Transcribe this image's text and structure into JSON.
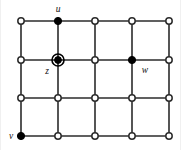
{
  "figure": {
    "background_color": "#ffffff",
    "edge_color": "#2b2b2b",
    "vertex_fill_color": "#000000",
    "vertex_open_color": "#ffffff",
    "label_color": "#111111"
  },
  "chart_data": {
    "type": "diagram",
    "subtype": "grid-graph",
    "title": "",
    "grid": {
      "columns": 5,
      "rows": 4,
      "column_x": [
        21,
        58,
        95,
        132,
        169
      ],
      "row_y": [
        21,
        60,
        98,
        136
      ],
      "cells_wide": 4,
      "cells_tall": 3
    },
    "vertices": [
      {
        "id": "r1c1",
        "col": 1,
        "row": 1,
        "x": 21,
        "y": 21,
        "style": "open",
        "label": ""
      },
      {
        "id": "r1c2",
        "col": 2,
        "row": 1,
        "x": 58,
        "y": 21,
        "style": "filled",
        "label": "u",
        "label_pos": "above"
      },
      {
        "id": "r1c3",
        "col": 3,
        "row": 1,
        "x": 95,
        "y": 21,
        "style": "open",
        "label": ""
      },
      {
        "id": "r1c4",
        "col": 4,
        "row": 1,
        "x": 132,
        "y": 21,
        "style": "open",
        "label": ""
      },
      {
        "id": "r1c5",
        "col": 5,
        "row": 1,
        "x": 169,
        "y": 21,
        "style": "open",
        "label": ""
      },
      {
        "id": "r2c1",
        "col": 1,
        "row": 2,
        "x": 21,
        "y": 60,
        "style": "open",
        "label": ""
      },
      {
        "id": "r2c2",
        "col": 2,
        "row": 2,
        "x": 58,
        "y": 60,
        "style": "ringed",
        "label": "z",
        "label_pos": "below-left"
      },
      {
        "id": "r2c3",
        "col": 3,
        "row": 2,
        "x": 95,
        "y": 60,
        "style": "open",
        "label": ""
      },
      {
        "id": "r2c4",
        "col": 4,
        "row": 2,
        "x": 132,
        "y": 60,
        "style": "filled",
        "label": "w",
        "label_pos": "below-right"
      },
      {
        "id": "r2c5",
        "col": 5,
        "row": 2,
        "x": 169,
        "y": 60,
        "style": "open",
        "label": ""
      },
      {
        "id": "r3c1",
        "col": 1,
        "row": 3,
        "x": 21,
        "y": 98,
        "style": "open",
        "label": ""
      },
      {
        "id": "r3c2",
        "col": 2,
        "row": 3,
        "x": 58,
        "y": 98,
        "style": "open",
        "label": ""
      },
      {
        "id": "r3c3",
        "col": 3,
        "row": 3,
        "x": 95,
        "y": 98,
        "style": "open",
        "label": ""
      },
      {
        "id": "r3c4",
        "col": 4,
        "row": 3,
        "x": 132,
        "y": 98,
        "style": "open",
        "label": ""
      },
      {
        "id": "r3c5",
        "col": 5,
        "row": 3,
        "x": 169,
        "y": 98,
        "style": "open",
        "label": ""
      },
      {
        "id": "r4c1",
        "col": 1,
        "row": 4,
        "x": 21,
        "y": 136,
        "style": "filled",
        "label": "v",
        "label_pos": "left"
      },
      {
        "id": "r4c2",
        "col": 2,
        "row": 4,
        "x": 58,
        "y": 136,
        "style": "open",
        "label": ""
      },
      {
        "id": "r4c3",
        "col": 3,
        "row": 4,
        "x": 95,
        "y": 136,
        "style": "open",
        "label": ""
      },
      {
        "id": "r4c4",
        "col": 4,
        "row": 4,
        "x": 132,
        "y": 136,
        "style": "open",
        "label": ""
      },
      {
        "id": "r4c5",
        "col": 5,
        "row": 4,
        "x": 169,
        "y": 136,
        "style": "open",
        "label": ""
      }
    ],
    "labels": [
      {
        "text": "u",
        "x": 58,
        "y": 12,
        "anchor": "middle",
        "vertex": "r1c2"
      },
      {
        "text": "z",
        "x": 47,
        "y": 74,
        "anchor": "middle",
        "vertex": "r2c2"
      },
      {
        "text": "w",
        "x": 145,
        "y": 73,
        "anchor": "middle",
        "vertex": "r2c4"
      },
      {
        "text": "v",
        "x": 11,
        "y": 139,
        "anchor": "middle",
        "vertex": "r4c1"
      }
    ],
    "edges_horizontal_rows": [
      1,
      2,
      3,
      4
    ],
    "edges_vertical_cols": [
      1,
      2,
      3,
      4,
      5
    ]
  }
}
